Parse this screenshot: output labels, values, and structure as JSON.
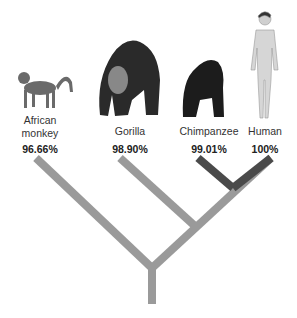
{
  "species": [
    {
      "name": "African monkey",
      "line1": "African",
      "line2": "monkey",
      "similarity": "96.66%",
      "icon": "monkey-icon"
    },
    {
      "name": "Gorilla",
      "line1": "Gorilla",
      "similarity": "98.90%",
      "icon": "gorilla-icon"
    },
    {
      "name": "Chimpanzee",
      "line1": "Chimpanzee",
      "similarity": "99.01%",
      "icon": "chimpanzee-icon"
    },
    {
      "name": "Human",
      "line1": "Human",
      "similarity": "100%",
      "icon": "human-icon"
    }
  ],
  "colors": {
    "branch_light": "#9a9a9a",
    "branch_dark": "#4a4a4a"
  }
}
